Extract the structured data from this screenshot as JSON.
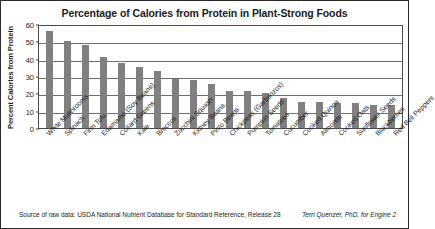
{
  "chart_data": {
    "type": "bar",
    "title": "Percentage of Calories from Protein in Plant-Strong Foods",
    "xlabel": "",
    "ylabel": "Percent Calories from Protein",
    "ylim": [
      0,
      60
    ],
    "ytick_labels": [
      "60",
      "50",
      "40",
      "30",
      "20",
      "10",
      "0"
    ],
    "yticks": [
      60,
      50,
      40,
      30,
      20,
      10,
      0
    ],
    "grid": true,
    "legend": null,
    "bar_color": "#808080",
    "categories": [
      "White Mushrooms",
      "Spinach",
      "Firm Tofu",
      "Edamame (Soy Beans)",
      "Collard Greens",
      "Kale",
      "Broccoli",
      "Zucchini Squash",
      "Kidney Beans",
      "Pinto Beans",
      "Chickpeas (Garbanzos)",
      "Pumpkin Seeds",
      "Tomatoes",
      "Cucumber",
      "Cooked Quinoa",
      "Almonds",
      "Cooked Oats",
      "Sunflower Seeds",
      "Blackberries",
      "Red Bell Peppers"
    ],
    "values": [
      56,
      50,
      48,
      41,
      37.5,
      35,
      33,
      28.5,
      27.5,
      25.5,
      21.5,
      21.5,
      20,
      17.5,
      15,
      15,
      14.5,
      14.5,
      13,
      13
    ]
  },
  "footer": {
    "source": "Source of raw data: USDA National Nutrient Database for Standard Reference, Release 28",
    "credit": "Terri Quenzer, PhD, for Engine 2"
  }
}
